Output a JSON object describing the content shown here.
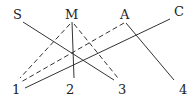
{
  "diagram": {
    "top_nodes": [
      {
        "id": "S",
        "label": "S",
        "x": 14,
        "y": 12
      },
      {
        "id": "M",
        "label": "M",
        "x": 66,
        "y": 12
      },
      {
        "id": "A",
        "label": "A",
        "x": 121,
        "y": 12
      },
      {
        "id": "C",
        "label": "C",
        "x": 174,
        "y": 9
      }
    ],
    "bottom_nodes": [
      {
        "id": "1",
        "label": "1",
        "x": 8,
        "y": 84
      },
      {
        "id": "2",
        "label": "2",
        "x": 68,
        "y": 84
      },
      {
        "id": "3",
        "label": "3",
        "x": 118,
        "y": 84
      },
      {
        "id": "4",
        "label": "4",
        "x": 179,
        "y": 84
      }
    ],
    "edges": [
      {
        "from": "S",
        "to": "3",
        "style": "solid"
      },
      {
        "from": "M",
        "to": "2",
        "style": "solid"
      },
      {
        "from": "M",
        "to": "1",
        "style": "dashed"
      },
      {
        "from": "M",
        "to": "3",
        "style": "dashed"
      },
      {
        "from": "A",
        "to": "1",
        "style": "dashed"
      },
      {
        "from": "A",
        "to": "4",
        "style": "solid"
      },
      {
        "from": "C",
        "to": "1",
        "style": "solid"
      }
    ],
    "line_color": "#333333"
  }
}
